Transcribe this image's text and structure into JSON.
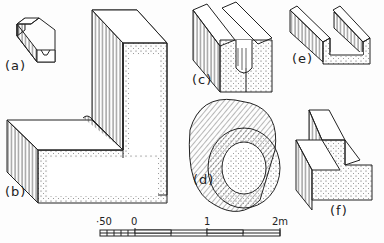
{
  "figure": {
    "panels": [
      {
        "id": "a",
        "label": "(a)",
        "description": "small double-channel block"
      },
      {
        "id": "b",
        "label": "(b)",
        "description": "L-shaped corner block"
      },
      {
        "id": "c",
        "label": "(c)",
        "description": "block with rounded groove"
      },
      {
        "id": "d",
        "label": "(d)",
        "description": "hollow cylindrical pipe"
      },
      {
        "id": "e",
        "label": "(e)",
        "description": "U-channel block"
      },
      {
        "id": "f",
        "label": "(f)",
        "description": "stepped block"
      }
    ],
    "scale_bar": {
      "ticks": [
        "·50",
        "0",
        "1",
        "2m"
      ],
      "unit": "m"
    },
    "colors": {
      "ink": "#222222",
      "paper": "#fdfdfd"
    }
  }
}
